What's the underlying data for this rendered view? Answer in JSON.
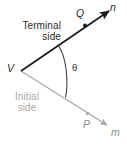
{
  "figure": {
    "colors": {
      "terminal_side": "#1a1a1a",
      "initial_side": "#a8a8a8",
      "arc": "#3a3a3a",
      "background": "#ffffff",
      "terminal_text": "#2b2b2b",
      "initial_text": "#a8a8a8"
    }
  },
  "labels": {
    "terminal_line1": "Terminal",
    "terminal_line2": "side",
    "initial_line1": "Initial",
    "initial_line2": "side",
    "vertex": "V",
    "angle": "θ",
    "point_q": "Q",
    "point_p": "P",
    "ray_n": "n",
    "ray_m": "m"
  },
  "geometry": {
    "vertex": [
      21,
      71
    ],
    "terminal_ray_end": [
      112,
      9
    ],
    "initial_ray_end": [
      110,
      127
    ],
    "point_q": [
      85,
      26
    ],
    "point_p": [
      88,
      118
    ],
    "arc_start": [
      58,
      45
    ],
    "arc_end": [
      66,
      97
    ]
  }
}
